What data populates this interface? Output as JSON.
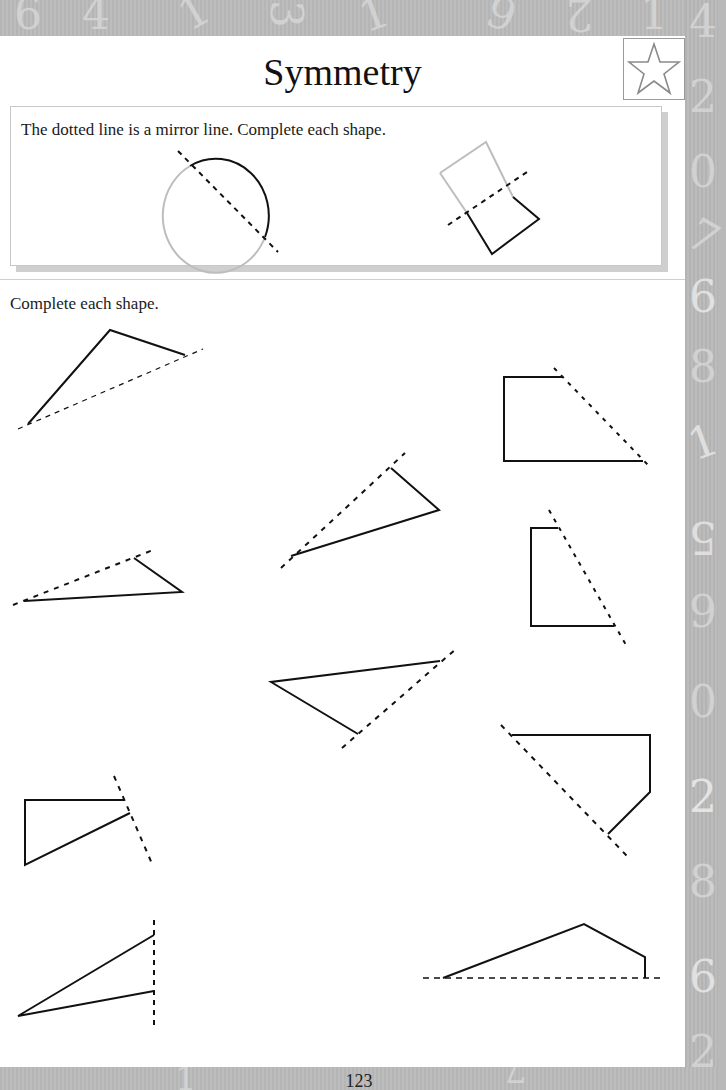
{
  "page": {
    "title": "Symmetry",
    "page_number": "123",
    "badge_icon": "star-icon"
  },
  "example": {
    "instruction": "The dotted line is a mirror line. Complete each shape.",
    "shapes": [
      {
        "name": "circle",
        "status": "completed example"
      },
      {
        "name": "rectangle",
        "status": "completed example"
      }
    ]
  },
  "exercise": {
    "instruction": "Complete each shape.",
    "shape_count": 10
  },
  "decorations": {
    "border_digits_top": [
      "6",
      "4",
      "1",
      "3",
      "1",
      "6",
      "9",
      "2",
      "1"
    ],
    "border_digits_right": [
      "4",
      "2",
      "0",
      "7",
      "6",
      "8",
      "1",
      "5",
      "9",
      "0",
      "2",
      "8",
      "6",
      "2"
    ],
    "border_digits_bottom": [
      "8",
      "1",
      "7"
    ]
  },
  "colors": {
    "border_gray": "#b9b9b9",
    "page_white": "#ffffff",
    "line_black": "#111111",
    "ghost_gray": "#bdbdbd"
  }
}
